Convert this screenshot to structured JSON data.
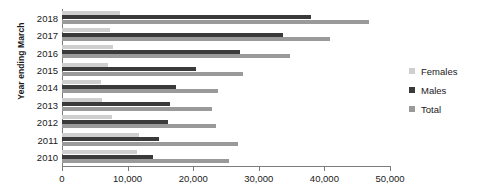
{
  "chart_data": {
    "type": "bar",
    "orientation": "horizontal",
    "title": "",
    "xlabel": "",
    "ylabel": "Year ending March",
    "categories": [
      "2018",
      "2017",
      "2016",
      "2015",
      "2014",
      "2013",
      "2012",
      "2011",
      "2010"
    ],
    "series": [
      {
        "name": "Females",
        "color": "#cfcfcf",
        "values": [
          8800,
          7300,
          7700,
          7000,
          6000,
          6100,
          7600,
          11700,
          11500
        ]
      },
      {
        "name": "Males",
        "color": "#3a3a3a",
        "values": [
          38000,
          33700,
          27100,
          20400,
          17400,
          16500,
          16200,
          14800,
          13800
        ]
      },
      {
        "name": "Total",
        "color": "#9a9a9a",
        "values": [
          46800,
          40800,
          34800,
          27600,
          23800,
          22900,
          23500,
          26800,
          25400
        ]
      }
    ],
    "xlim": [
      0,
      50000
    ],
    "xticks": [
      0,
      10000,
      20000,
      30000,
      40000,
      50000
    ],
    "xtick_labels": [
      "0",
      "10,000",
      "20,000",
      "30,000",
      "40,000",
      "50,000"
    ],
    "grid": false,
    "legend_position": "right"
  },
  "axis": {
    "y_title": "Year ending March"
  },
  "legend": {
    "items": [
      {
        "label": "Females",
        "color": "#cfcfcf"
      },
      {
        "label": "Males",
        "color": "#3a3a3a"
      },
      {
        "label": "Total",
        "color": "#9a9a9a"
      }
    ]
  }
}
